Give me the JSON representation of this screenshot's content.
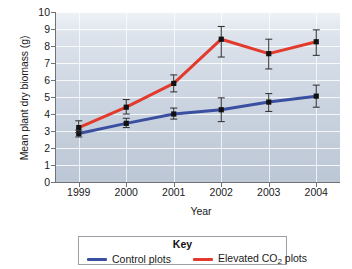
{
  "chart_data": {
    "type": "line",
    "title": "",
    "xlabel": "Year",
    "ylabel": "Mean plant dry biomass (g)",
    "categories": [
      "1999",
      "2000",
      "2001",
      "2002",
      "2003",
      "2004"
    ],
    "x": [
      1999,
      2000,
      2001,
      2002,
      2003,
      2004
    ],
    "ylim": [
      0,
      10
    ],
    "yticks": [
      "0",
      "1",
      "2",
      "3",
      "4",
      "5",
      "6",
      "7",
      "8",
      "9",
      "10"
    ],
    "ytick_values": [
      0,
      1,
      2,
      3,
      4,
      5,
      6,
      7,
      8,
      9,
      10
    ],
    "grid": "horizontal-and-vertical",
    "legend_position": "below-plot",
    "legend_title": "Key",
    "markers": "filled-square-with-error-bars",
    "series": [
      {
        "name": "Control plots",
        "color": "#3a4fa0",
        "values": [
          2.85,
          3.45,
          4.0,
          4.25,
          4.7,
          5.05
        ],
        "error_low": [
          2.65,
          3.2,
          3.7,
          3.55,
          4.15,
          4.4
        ],
        "error_high": [
          3.05,
          3.75,
          4.35,
          4.95,
          5.2,
          5.7
        ]
      },
      {
        "name": "Elevated CO2 plots",
        "color": "#e23b2e",
        "values": [
          3.2,
          4.4,
          5.8,
          8.4,
          7.55,
          8.25
        ],
        "error_low": [
          2.9,
          4.0,
          5.3,
          7.35,
          6.65,
          7.45
        ],
        "error_high": [
          3.6,
          4.85,
          6.3,
          9.15,
          8.4,
          8.95
        ]
      }
    ]
  },
  "legend": {
    "title": "Key",
    "entries": [
      {
        "label": "Control plots",
        "color": "#3a4fa0"
      },
      {
        "label_prefix": "Elevated CO",
        "label_sub": "2",
        "label_suffix": " plots",
        "color": "#e23b2e"
      }
    ]
  },
  "axes": {
    "y_title": "Mean plant dry biomass (g)",
    "x_title": "Year"
  },
  "colors": {
    "control": "#3a4fa0",
    "elevated": "#e23b2e",
    "plot_background_top": "#eef2f7",
    "plot_background_bottom": "#bcc7d6",
    "axis": "#6f7276",
    "gridline": "#ffffff",
    "marker": "#111111"
  }
}
